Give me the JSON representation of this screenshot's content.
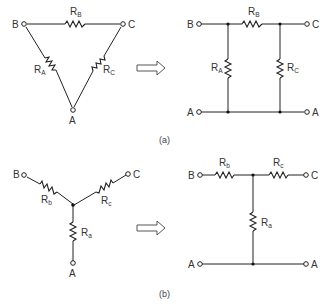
{
  "figure": {
    "panel_a": {
      "caption": "(a)",
      "delta": {
        "nodes": {
          "B": "B",
          "C": "C",
          "A": "A"
        },
        "resistors": {
          "top": {
            "main": "R",
            "sub": "B"
          },
          "left": {
            "main": "R",
            "sub": "A"
          },
          "right": {
            "main": "R",
            "sub": "C"
          }
        }
      },
      "pi_network": {
        "terminals": {
          "top_left": "B",
          "top_right": "C",
          "bottom_left": "A",
          "bottom_right": "A"
        },
        "resistors": {
          "series": {
            "main": "R",
            "sub": "B"
          },
          "shunt_left": {
            "main": "R",
            "sub": "A"
          },
          "shunt_right": {
            "main": "R",
            "sub": "C"
          }
        }
      }
    },
    "panel_b": {
      "caption": "(b)",
      "wye": {
        "nodes": {
          "B": "B",
          "C": "C",
          "A": "A"
        },
        "resistors": {
          "left": {
            "main": "R",
            "sub": "b"
          },
          "right": {
            "main": "R",
            "sub": "c"
          },
          "bottom": {
            "main": "R",
            "sub": "a"
          }
        }
      },
      "t_network": {
        "terminals": {
          "top_left": "B",
          "top_right": "C",
          "bottom_left": "A",
          "bottom_right": "A"
        },
        "resistors": {
          "series_left": {
            "main": "R",
            "sub": "b"
          },
          "series_right": {
            "main": "R",
            "sub": "c"
          },
          "shunt": {
            "main": "R",
            "sub": "a"
          }
        }
      }
    },
    "arrows": [
      "transform-arrow-a",
      "transform-arrow-b"
    ]
  }
}
